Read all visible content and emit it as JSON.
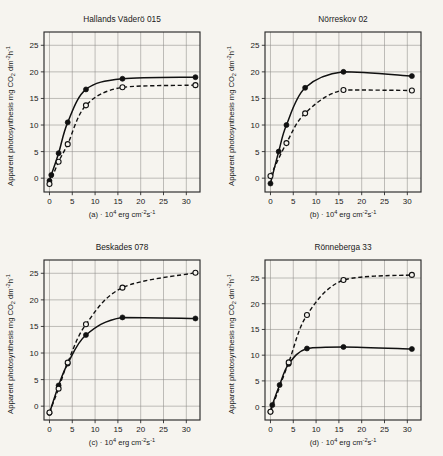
{
  "figure": {
    "background_color": "#f6f4ef",
    "ink_color": "#111111",
    "grid_color": "#8e8c87",
    "ylabel": "Apparent photosynthesis mg CO",
    "ylabel_sub": "2",
    "ylabel_tail": " dm",
    "ylabel_sup1": "-2",
    "ylabel_mid": "h",
    "ylabel_sup2": "-1",
    "xlabel_lead": "· 10",
    "xlabel_sup1": "4",
    "xlabel_mid": " erg cm",
    "xlabel_sup2": "-2",
    "xlabel_tail": "s",
    "xlabel_sup3": "-1",
    "yticks": [
      "0",
      "5",
      "10",
      "15",
      "20",
      "25"
    ],
    "xticks": [
      "0",
      "5",
      "10",
      "15",
      "20",
      "25",
      "30"
    ]
  },
  "chart_data": [
    {
      "type": "line",
      "panel": "a",
      "panel_label": "(a)",
      "title": "Hallands Väderö 015",
      "xlabel": "· 10^4 erg cm^-2 s^-1",
      "ylabel": "Apparent photosynthesis mg CO2 dm^-2 h^-1",
      "xlim": [
        -1.2,
        33
      ],
      "ylim": [
        -2.6,
        27.5
      ],
      "grid": true,
      "series": [
        {
          "name": "filled-circles",
          "marker": "filled-circle",
          "line": "solid",
          "x": [
            0,
            0.4,
            2,
            4,
            8,
            16,
            32
          ],
          "y": [
            -0.5,
            0.6,
            4.7,
            10.5,
            16.7,
            18.7,
            19.0
          ]
        },
        {
          "name": "open-circles",
          "marker": "open-circle",
          "line": "dashed",
          "x": [
            0,
            2,
            4,
            8,
            16,
            32
          ],
          "y": [
            -1.1,
            3.1,
            6.4,
            13.7,
            17.1,
            17.5
          ]
        }
      ]
    },
    {
      "type": "line",
      "panel": "b",
      "panel_label": "(b)",
      "title": "Nörreskov 02",
      "xlabel": "· 10^4 erg cm^-2 s^-1",
      "ylabel": "Apparent photosynthesis mg CO2 dm^-2 h^-1",
      "xlim": [
        -1.2,
        33
      ],
      "ylim": [
        -2.6,
        27.5
      ],
      "grid": true,
      "series": [
        {
          "name": "filled-circles",
          "marker": "filled-circle",
          "line": "solid",
          "x": [
            0,
            1.8,
            3.5,
            7.6,
            16,
            31
          ],
          "y": [
            -1.0,
            5.0,
            10.0,
            17.0,
            20.0,
            19.2
          ]
        },
        {
          "name": "open-circles",
          "marker": "open-circle",
          "line": "dashed",
          "x": [
            0,
            3.5,
            7.6,
            16,
            31
          ],
          "y": [
            0.4,
            6.6,
            12.2,
            16.6,
            16.5
          ]
        }
      ]
    },
    {
      "type": "line",
      "panel": "c",
      "panel_label": "(c)",
      "title": "Beskades 078",
      "xlabel": "· 10^4 erg cm^-2 s^-1",
      "ylabel": "Apparent photosynthesis mg CO2 dm^-2 h^-1",
      "xlim": [
        -1.2,
        33
      ],
      "ylim": [
        -2.6,
        27.5
      ],
      "grid": true,
      "series": [
        {
          "name": "filled-circles",
          "marker": "filled-circle",
          "line": "solid",
          "x": [
            0,
            2,
            4,
            8,
            16,
            32
          ],
          "y": [
            -1.3,
            3.9,
            8.0,
            13.4,
            16.7,
            16.5
          ]
        },
        {
          "name": "open-circles",
          "marker": "open-circle",
          "line": "dashed",
          "x": [
            0,
            2,
            4,
            8,
            16,
            32
          ],
          "y": [
            -1.2,
            3.3,
            8.2,
            15.4,
            22.3,
            25.1
          ]
        }
      ]
    },
    {
      "type": "line",
      "panel": "d",
      "panel_label": "(d)",
      "title": "Rönneberga 33",
      "xlabel": "· 10^4 erg cm^-2 s^-1",
      "ylabel": "Apparent photosynthesis mg CO2 dm^-2 h^-1",
      "xlim": [
        -1.2,
        33
      ],
      "ylim": [
        -2.6,
        28.5
      ],
      "grid": true,
      "series": [
        {
          "name": "filled-circles",
          "marker": "filled-circle",
          "line": "solid",
          "x": [
            0,
            0.4,
            2,
            4,
            8,
            16,
            31
          ],
          "y": [
            -1.0,
            0.3,
            4.2,
            8.3,
            11.3,
            11.6,
            11.2
          ]
        },
        {
          "name": "open-circles",
          "marker": "open-circle",
          "line": "dashed",
          "x": [
            0,
            4,
            8,
            16,
            31
          ],
          "y": [
            -1.0,
            8.6,
            17.8,
            24.6,
            25.6
          ]
        }
      ]
    }
  ]
}
